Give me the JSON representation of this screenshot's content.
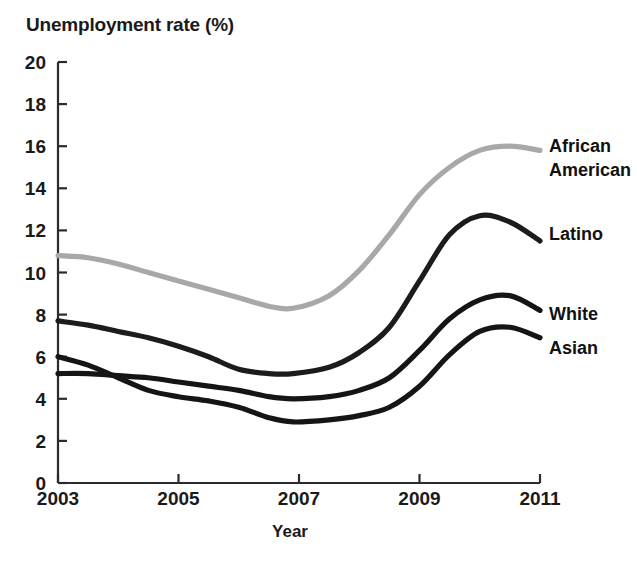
{
  "chart_data": {
    "type": "line",
    "title": "",
    "xlabel": "Year",
    "ylabel": "Unemployment rate (%)",
    "xlim": [
      2003,
      2011
    ],
    "ylim": [
      0,
      20
    ],
    "grid": false,
    "legend_position": "right-inline-labels",
    "x_ticks": [
      "2003",
      "2005",
      "2007",
      "2009",
      "2011"
    ],
    "x_tick_values": [
      2003,
      2005,
      2007,
      2009,
      2011
    ],
    "y_ticks": [
      "0",
      "2",
      "4",
      "6",
      "8",
      "10",
      "12",
      "14",
      "16",
      "18",
      "20"
    ],
    "y_tick_values": [
      0,
      2,
      4,
      6,
      8,
      10,
      12,
      14,
      16,
      18,
      20
    ],
    "x": [
      2003,
      2003.5,
      2004,
      2004.5,
      2005,
      2005.5,
      2006,
      2006.5,
      2006.9,
      2007.5,
      2008,
      2008.5,
      2009,
      2009.5,
      2010,
      2010.5,
      2011
    ],
    "series": [
      {
        "name": "African American",
        "color": "#a8a8a8",
        "label_color": "#111111",
        "values": [
          10.8,
          10.7,
          10.4,
          10.0,
          9.6,
          9.2,
          8.8,
          8.4,
          8.3,
          8.9,
          10.1,
          11.8,
          13.7,
          15.0,
          15.8,
          16.0,
          15.8
        ]
      },
      {
        "name": "Latino",
        "color": "#1c1c1c",
        "label_color": "#111111",
        "values": [
          7.7,
          7.5,
          7.2,
          6.9,
          6.5,
          6.0,
          5.4,
          5.2,
          5.2,
          5.5,
          6.2,
          7.4,
          9.6,
          11.8,
          12.7,
          12.4,
          11.5
        ]
      },
      {
        "name": "White",
        "color": "#151515",
        "label_color": "#111111",
        "values": [
          5.2,
          5.2,
          5.1,
          5.0,
          4.8,
          4.6,
          4.4,
          4.1,
          4.0,
          4.1,
          4.4,
          5.0,
          6.3,
          7.8,
          8.7,
          8.9,
          8.2
        ]
      },
      {
        "name": "Asian",
        "color": "#151515",
        "label_color": "#111111",
        "values": [
          6.0,
          5.6,
          5.0,
          4.4,
          4.1,
          3.9,
          3.6,
          3.1,
          2.9,
          3.0,
          3.2,
          3.6,
          4.6,
          6.1,
          7.2,
          7.4,
          6.9
        ]
      }
    ],
    "series_label_positions": [
      {
        "name": "African American",
        "lines": [
          "African",
          "American"
        ],
        "x": 549,
        "y": 152
      },
      {
        "name": "Latino",
        "lines": [
          "Latino"
        ],
        "x": 549,
        "y": 240
      },
      {
        "name": "White",
        "lines": [
          "White"
        ],
        "x": 549,
        "y": 320
      },
      {
        "name": "Asian",
        "lines": [
          "Asian"
        ],
        "x": 549,
        "y": 354
      }
    ]
  },
  "axis_geometry": {
    "plot_left": 58,
    "plot_right": 540,
    "plot_top": 62,
    "plot_bottom": 483
  }
}
